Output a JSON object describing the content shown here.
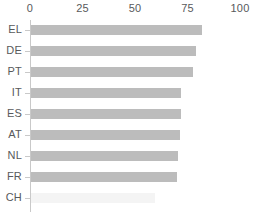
{
  "chart_data": {
    "type": "bar",
    "orientation": "horizontal",
    "title": "",
    "subtitle": "",
    "xlabel": "",
    "ylabel": "",
    "categories": [
      "EL",
      "DE",
      "PT",
      "IT",
      "ES",
      "AT",
      "NL",
      "FR",
      "CH"
    ],
    "values": [
      82,
      79,
      77.5,
      72,
      72,
      71.5,
      70.5,
      70,
      0
    ],
    "series": [
      {
        "name": "",
        "values": [
          82,
          79,
          77.5,
          72,
          72,
          71.5,
          70.5,
          70,
          0
        ]
      }
    ],
    "xlim": [
      0,
      100
    ],
    "xticks": [
      0,
      25,
      50,
      75,
      100
    ],
    "xtick_labels": [
      "0",
      "25",
      "50",
      "75",
      "100"
    ],
    "grid": false,
    "legend": false,
    "legend_position": "none",
    "axis_position": "top",
    "bar_color": "#bcbcbc",
    "faint_bar_color": "#f4f4f4",
    "axis_color": "#c9c9c9",
    "text_color": "#58595b",
    "background_color": "#ffffff",
    "annotations": []
  }
}
